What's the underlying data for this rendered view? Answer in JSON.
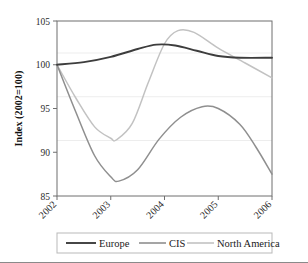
{
  "chart_data": {
    "type": "line",
    "title": "",
    "xlabel": "",
    "ylabel": "Index (2002=100)",
    "xlim": [
      2002,
      2006
    ],
    "ylim": [
      85,
      105
    ],
    "yticks": [
      85,
      90,
      95,
      100,
      105
    ],
    "xticks": [
      "2002",
      "2003",
      "2004",
      "2005",
      "2006"
    ],
    "grid": true,
    "legend_position": "bottom",
    "x": [
      2002,
      2006
    ],
    "series": [
      {
        "name": "Europe",
        "color": "#3d3d3d",
        "points": [
          {
            "x": 2002.0,
            "y": 100.0
          },
          {
            "x": 2002.5,
            "y": 100.3
          },
          {
            "x": 2003.0,
            "y": 100.9
          },
          {
            "x": 2003.5,
            "y": 101.8
          },
          {
            "x": 2003.85,
            "y": 102.3
          },
          {
            "x": 2004.2,
            "y": 102.2
          },
          {
            "x": 2004.6,
            "y": 101.6
          },
          {
            "x": 2005.0,
            "y": 101.0
          },
          {
            "x": 2005.4,
            "y": 100.8
          },
          {
            "x": 2006.0,
            "y": 100.8
          }
        ]
      },
      {
        "name": "CIS",
        "color": "#8f8f8f",
        "points": [
          {
            "x": 2002.0,
            "y": 100.0
          },
          {
            "x": 2002.35,
            "y": 94.6
          },
          {
            "x": 2002.7,
            "y": 89.6
          },
          {
            "x": 2003.0,
            "y": 87.2
          },
          {
            "x": 2003.15,
            "y": 86.7
          },
          {
            "x": 2003.5,
            "y": 88.0
          },
          {
            "x": 2003.9,
            "y": 91.5
          },
          {
            "x": 2004.3,
            "y": 94.0
          },
          {
            "x": 2004.7,
            "y": 95.2
          },
          {
            "x": 2005.0,
            "y": 95.0
          },
          {
            "x": 2005.4,
            "y": 93.2
          },
          {
            "x": 2005.7,
            "y": 90.6
          },
          {
            "x": 2006.0,
            "y": 87.5
          }
        ]
      },
      {
        "name": "North America",
        "color": "#c2c2c2",
        "points": [
          {
            "x": 2002.0,
            "y": 100.0
          },
          {
            "x": 2002.35,
            "y": 96.2
          },
          {
            "x": 2002.7,
            "y": 92.9
          },
          {
            "x": 2003.0,
            "y": 91.6
          },
          {
            "x": 2003.1,
            "y": 91.4
          },
          {
            "x": 2003.4,
            "y": 93.3
          },
          {
            "x": 2003.7,
            "y": 98.0
          },
          {
            "x": 2004.0,
            "y": 102.4
          },
          {
            "x": 2004.25,
            "y": 103.9
          },
          {
            "x": 2004.55,
            "y": 103.7
          },
          {
            "x": 2005.0,
            "y": 101.9
          },
          {
            "x": 2005.5,
            "y": 100.2
          },
          {
            "x": 2006.0,
            "y": 98.5
          }
        ]
      }
    ]
  },
  "yaxis": {
    "label": "Index (2002=100)",
    "ticks": [
      "105",
      "100",
      "95",
      "90",
      "85"
    ]
  },
  "xaxis": {
    "ticks": [
      "2002",
      "2003",
      "2004",
      "2005",
      "2006"
    ]
  },
  "legend": {
    "entries": [
      {
        "label": "Europe",
        "color": "#3d3d3d"
      },
      {
        "label": "CIS",
        "color": "#8f8f8f"
      },
      {
        "label": "North America",
        "color": "#c2c2c2"
      }
    ]
  }
}
